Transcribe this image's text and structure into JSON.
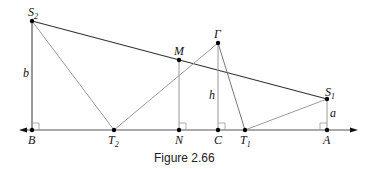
{
  "figure": {
    "caption": "Figure 2.66",
    "points": {
      "S2": {
        "label": "S",
        "sub": "2"
      },
      "S1": {
        "label": "S",
        "sub": "1"
      },
      "M": {
        "label": "M"
      },
      "Gamma": {
        "label": "Γ"
      },
      "B": {
        "label": "B"
      },
      "T2": {
        "label": "T",
        "sub": "2"
      },
      "N": {
        "label": "N"
      },
      "C": {
        "label": "C"
      },
      "T1": {
        "label": "T",
        "sub": "1"
      },
      "A": {
        "label": "A"
      }
    },
    "segment_labels": {
      "b": "b",
      "h": "h",
      "a": "a"
    },
    "colors": {
      "dark_line": "#333333",
      "light_line": "#9a9a9a",
      "point": "#000000"
    }
  }
}
